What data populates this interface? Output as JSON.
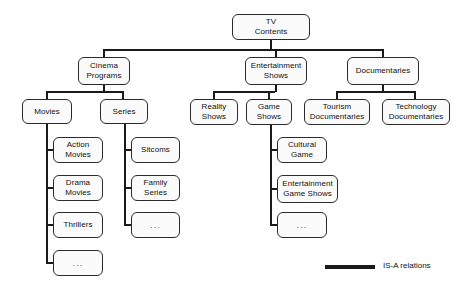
{
  "diagram": {
    "title_node": "TV\nContents",
    "nodes": [
      {
        "id": "tv-contents",
        "label": "TV\nContents",
        "x": 232,
        "y": 14,
        "w": 78,
        "h": 26,
        "ellipsis": false
      },
      {
        "id": "cinema-programs",
        "label": "Cinema\nPrograms",
        "x": 78,
        "y": 57,
        "w": 52,
        "h": 28,
        "ellipsis": false
      },
      {
        "id": "entertainment-shows",
        "label": "Entertainment\nShows",
        "x": 245,
        "y": 57,
        "w": 62,
        "h": 28,
        "ellipsis": false
      },
      {
        "id": "documentaries",
        "label": "Documentaries",
        "x": 347,
        "y": 57,
        "w": 72,
        "h": 28,
        "ellipsis": false
      },
      {
        "id": "movies",
        "label": "Movies",
        "x": 22,
        "y": 99,
        "w": 50,
        "h": 25,
        "ellipsis": false
      },
      {
        "id": "series",
        "label": "Series",
        "x": 100,
        "y": 99,
        "w": 48,
        "h": 25,
        "ellipsis": false
      },
      {
        "id": "reality-shows",
        "label": "Reality\nShows",
        "x": 190,
        "y": 99,
        "w": 48,
        "h": 26,
        "ellipsis": false
      },
      {
        "id": "game-shows",
        "label": "Game\nShows",
        "x": 246,
        "y": 99,
        "w": 46,
        "h": 26,
        "ellipsis": false
      },
      {
        "id": "tourism-documentaries",
        "label": "Tourism\nDocumentaries",
        "x": 304,
        "y": 99,
        "w": 66,
        "h": 26,
        "ellipsis": false
      },
      {
        "id": "technology-documentaries",
        "label": "Technology\nDocumentaries",
        "x": 382,
        "y": 99,
        "w": 68,
        "h": 26,
        "ellipsis": false
      },
      {
        "id": "action-movies",
        "label": "Action\nMovies",
        "x": 53,
        "y": 137,
        "w": 50,
        "h": 26,
        "ellipsis": false
      },
      {
        "id": "drama-movies",
        "label": "Drama\nMovies",
        "x": 53,
        "y": 175,
        "w": 50,
        "h": 26,
        "ellipsis": false
      },
      {
        "id": "thrillers",
        "label": "Thrillers",
        "x": 53,
        "y": 212,
        "w": 50,
        "h": 26,
        "ellipsis": false
      },
      {
        "id": "movies-more",
        "label": "...",
        "x": 53,
        "y": 250,
        "w": 50,
        "h": 26,
        "ellipsis": true
      },
      {
        "id": "sitcoms",
        "label": "Sitcoms",
        "x": 131,
        "y": 137,
        "w": 49,
        "h": 26,
        "ellipsis": false
      },
      {
        "id": "family-series",
        "label": "Family\nSeries",
        "x": 131,
        "y": 175,
        "w": 49,
        "h": 26,
        "ellipsis": false
      },
      {
        "id": "series-more",
        "label": "...",
        "x": 131,
        "y": 212,
        "w": 49,
        "h": 26,
        "ellipsis": true
      },
      {
        "id": "cultural-game",
        "label": "Cultural\nGame",
        "x": 277,
        "y": 137,
        "w": 50,
        "h": 26,
        "ellipsis": false
      },
      {
        "id": "entertainment-game-shows",
        "label": "Entertainment\nGame Shows",
        "x": 277,
        "y": 175,
        "w": 61,
        "h": 28,
        "ellipsis": false
      },
      {
        "id": "game-shows-more",
        "label": "...",
        "x": 277,
        "y": 212,
        "w": 50,
        "h": 26,
        "ellipsis": true
      }
    ],
    "edges": [
      {
        "id": "root-stub",
        "x": 270,
        "y": 40,
        "w": 2,
        "h": 11
      },
      {
        "id": "root-bus",
        "x": 103,
        "y": 49,
        "w": 281,
        "h": 2
      },
      {
        "id": "root-to-cinema",
        "x": 103,
        "y": 49,
        "w": 2,
        "h": 9
      },
      {
        "id": "root-to-entertain",
        "x": 275,
        "y": 49,
        "w": 2,
        "h": 9
      },
      {
        "id": "root-to-docs",
        "x": 382,
        "y": 49,
        "w": 2,
        "h": 9
      },
      {
        "id": "cinema-stub",
        "x": 103,
        "y": 85,
        "w": 2,
        "h": 7
      },
      {
        "id": "cinema-bus",
        "x": 46,
        "y": 91,
        "w": 78,
        "h": 2
      },
      {
        "id": "cinema-to-movies",
        "x": 46,
        "y": 91,
        "w": 2,
        "h": 9
      },
      {
        "id": "cinema-to-series",
        "x": 122,
        "y": 91,
        "w": 2,
        "h": 9
      },
      {
        "id": "entertain-stub",
        "x": 275,
        "y": 85,
        "w": 2,
        "h": 7
      },
      {
        "id": "entertain-bus",
        "x": 213,
        "y": 91,
        "w": 62,
        "h": 2
      },
      {
        "id": "entertain-to-reality",
        "x": 213,
        "y": 91,
        "w": 2,
        "h": 9
      },
      {
        "id": "entertain-to-game",
        "x": 268,
        "y": 91,
        "w": 2,
        "h": 9
      },
      {
        "id": "docs-stub",
        "x": 382,
        "y": 85,
        "w": 2,
        "h": 7
      },
      {
        "id": "docs-bus",
        "x": 336,
        "y": 91,
        "w": 80,
        "h": 2
      },
      {
        "id": "docs-to-tourism",
        "x": 336,
        "y": 91,
        "w": 2,
        "h": 9
      },
      {
        "id": "docs-to-technology",
        "x": 414,
        "y": 91,
        "w": 2,
        "h": 9
      },
      {
        "id": "movies-trunk",
        "x": 46,
        "y": 124,
        "w": 2,
        "h": 139
      },
      {
        "id": "movies-to-action",
        "x": 46,
        "y": 149,
        "w": 8,
        "h": 2
      },
      {
        "id": "movies-to-drama",
        "x": 46,
        "y": 187,
        "w": 8,
        "h": 2
      },
      {
        "id": "movies-to-thrillers",
        "x": 46,
        "y": 224,
        "w": 8,
        "h": 2
      },
      {
        "id": "movies-to-more",
        "x": 46,
        "y": 262,
        "w": 8,
        "h": 2
      },
      {
        "id": "series-trunk",
        "x": 124,
        "y": 124,
        "w": 2,
        "h": 101
      },
      {
        "id": "series-to-sitcoms",
        "x": 124,
        "y": 149,
        "w": 8,
        "h": 2
      },
      {
        "id": "series-to-family",
        "x": 124,
        "y": 187,
        "w": 8,
        "h": 2
      },
      {
        "id": "series-to-more",
        "x": 124,
        "y": 224,
        "w": 8,
        "h": 2
      },
      {
        "id": "game-trunk",
        "x": 270,
        "y": 125,
        "w": 2,
        "h": 100
      },
      {
        "id": "game-to-cultural",
        "x": 270,
        "y": 149,
        "w": 8,
        "h": 2
      },
      {
        "id": "game-to-ent-game",
        "x": 270,
        "y": 188,
        "w": 8,
        "h": 2
      },
      {
        "id": "game-to-more",
        "x": 270,
        "y": 224,
        "w": 8,
        "h": 2
      }
    ],
    "legend": {
      "label": "IS-A relations",
      "line_color": "#1a1a1a",
      "line_x": 325,
      "line_y": 265,
      "line_w": 50,
      "line_h": 4,
      "label_x": 383,
      "label_y": 261
    }
  }
}
